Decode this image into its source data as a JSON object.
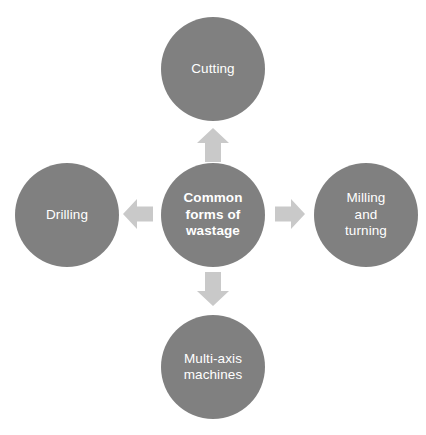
{
  "diagram": {
    "type": "hub-and-spoke",
    "background_color": "#ffffff",
    "node_color": "#808080",
    "arrow_color": "#c9c9c9",
    "text_color": "#ffffff",
    "center": {
      "label": "Common forms of wastage",
      "label_lines": "Common\nforms of\nwastage"
    },
    "nodes": [
      {
        "position": "top",
        "label": "Cutting",
        "label_lines": "Cutting"
      },
      {
        "position": "right",
        "label": "Milling and turning",
        "label_lines": "Milling\nand\nturning"
      },
      {
        "position": "bottom",
        "label": "Multi-axis machines",
        "label_lines": "Multi-axis\nmachines"
      },
      {
        "position": "left",
        "label": "Drilling",
        "label_lines": "Drilling"
      }
    ],
    "arrows": [
      {
        "name": "arrow-up",
        "direction": "up",
        "from": "center",
        "to": "top"
      },
      {
        "name": "arrow-right",
        "direction": "right",
        "from": "center",
        "to": "right"
      },
      {
        "name": "arrow-down",
        "direction": "down",
        "from": "center",
        "to": "bottom"
      },
      {
        "name": "arrow-left",
        "direction": "left",
        "from": "center",
        "to": "left"
      }
    ]
  }
}
